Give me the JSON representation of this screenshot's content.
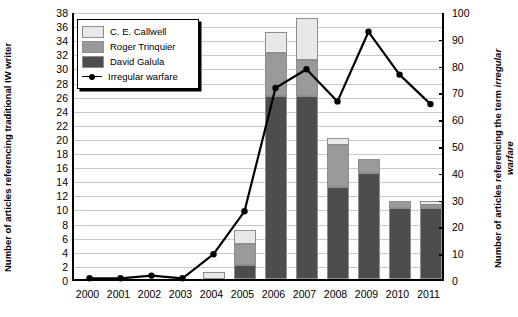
{
  "chart_data": {
    "type": "bar",
    "title": "",
    "xlabel": "",
    "ylabel": "Number of articles referencing traditional IW writer",
    "y2label_part1": "Number of articles referencing the term ",
    "y2label_part2": "irregular warfare",
    "categories": [
      "2000",
      "2001",
      "2002",
      "2003",
      "2004",
      "2005",
      "2006",
      "2007",
      "2008",
      "2009",
      "2010",
      "2011"
    ],
    "ylim": [
      0,
      38
    ],
    "y2lim": [
      0,
      100
    ],
    "yticks": [
      0,
      2,
      4,
      6,
      8,
      10,
      12,
      14,
      16,
      18,
      20,
      22,
      24,
      26,
      28,
      30,
      32,
      34,
      36,
      38
    ],
    "y2ticks": [
      0,
      10,
      20,
      30,
      40,
      50,
      60,
      70,
      80,
      90,
      100
    ],
    "grid": true,
    "legend_position": "top-left",
    "stacked": true,
    "series": [
      {
        "name": "David Galula",
        "type": "bar",
        "axis": "left",
        "color": "#4d4d4d",
        "values": [
          0,
          0,
          0,
          0,
          0,
          2,
          26,
          26,
          13,
          15,
          10,
          10
        ]
      },
      {
        "name": "Roger Trinquier",
        "type": "bar",
        "axis": "left",
        "color": "#9a9a9a",
        "values": [
          0,
          0,
          0,
          0,
          0,
          3,
          6,
          5,
          6,
          2,
          1,
          0.5
        ]
      },
      {
        "name": "C. E. Callwell",
        "type": "bar",
        "axis": "left",
        "color": "#e8e8e8",
        "values": [
          0,
          0,
          0,
          0,
          1,
          2,
          3,
          6,
          1,
          0,
          0,
          0.5
        ]
      },
      {
        "name": "Irregular warfare",
        "type": "line",
        "axis": "right",
        "color": "#000000",
        "values": [
          1,
          1,
          2,
          1,
          10,
          26,
          72,
          79,
          67,
          93,
          77,
          66
        ]
      }
    ],
    "bar_totals": [
      0,
      0,
      0,
      0,
      1,
      7,
      35,
      37,
      20,
      17,
      11,
      11
    ]
  },
  "legend": {
    "items": [
      {
        "label": "C. E. Callwell",
        "marker": "swatch-callwell"
      },
      {
        "label": "Roger Trinquier",
        "marker": "swatch-trinquier"
      },
      {
        "label": "David Galula",
        "marker": "swatch-galula"
      },
      {
        "label": "Irregular warfare",
        "marker": "line-marker"
      }
    ]
  }
}
